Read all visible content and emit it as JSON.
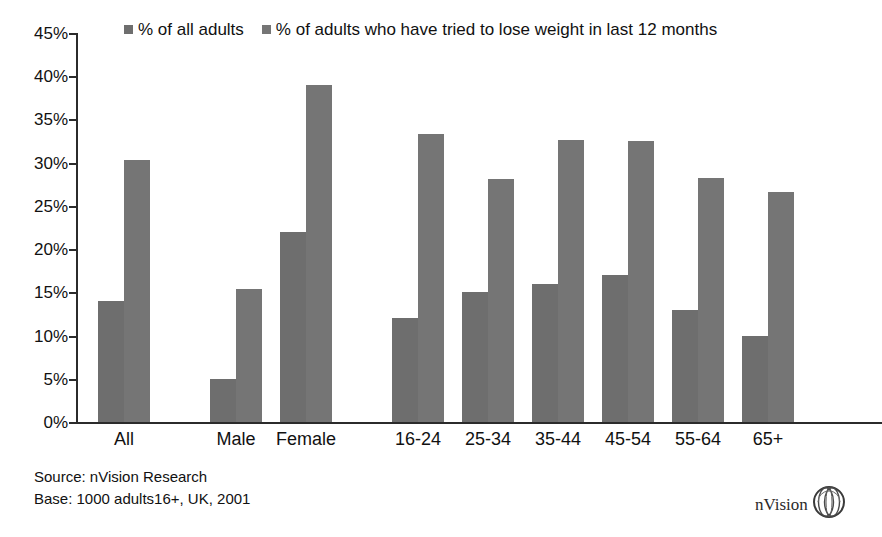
{
  "chart_data": {
    "type": "bar",
    "title": "",
    "subtitle": "",
    "xlabel": "",
    "ylabel": "",
    "ylim": [
      0,
      45
    ],
    "ytick_step": 5,
    "ytick_labels": [
      "45%",
      "40%",
      "35%",
      "30%",
      "25%",
      "20%",
      "15%",
      "10%",
      "5%",
      "0%"
    ],
    "ytick_values": [
      45,
      40,
      35,
      30,
      25,
      20,
      15,
      10,
      5,
      0
    ],
    "grid": false,
    "legend_position": "top",
    "categories": [
      "All",
      "Male",
      "Female",
      "16-24",
      "25-34",
      "35-44",
      "45-54",
      "55-64",
      "65+"
    ],
    "group_gaps_after": [
      "All",
      "Female"
    ],
    "series": [
      {
        "name": "% of all adults",
        "color": "#6e6e6e",
        "values": [
          14.0,
          5.0,
          22.0,
          12.0,
          15.0,
          16.0,
          17.0,
          13.0,
          10.0
        ]
      },
      {
        "name": "% of adults who have tried to lose weight in last 12 months",
        "color": "#757575",
        "values": [
          30.3,
          15.4,
          39.0,
          33.3,
          28.1,
          32.6,
          32.5,
          28.2,
          26.6
        ]
      }
    ]
  },
  "legend": {
    "entries": [
      {
        "label": "% of all adults",
        "swatch_color": "#6e6e6e",
        "marker": "square-swatch-icon"
      },
      {
        "label": "% of adults who have tried to lose weight in last 12 months",
        "swatch_color": "#757575",
        "marker": "square-swatch-icon"
      }
    ]
  },
  "footer": {
    "source": "Source: nVision Research",
    "base": "Base: 1000 adults16+, UK, 2001"
  },
  "brand": {
    "name": "nVision",
    "logo_icon": "nvision-sphere-logo-icon"
  },
  "colors": {
    "axis": "#2b2b2b",
    "bar_series_1": "#6e6e6e",
    "bar_series_2": "#757575",
    "text": "#111111",
    "background": "#ffffff"
  }
}
